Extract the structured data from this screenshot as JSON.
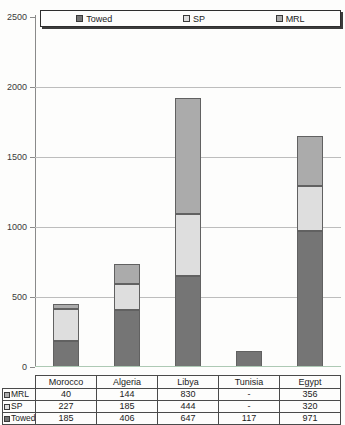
{
  "chart_data": {
    "type": "bar",
    "stacked": true,
    "title": "",
    "xlabel": "",
    "ylabel": "",
    "categories": [
      "Morocco",
      "Algeria",
      "Libya",
      "Tunisia",
      "Egypt"
    ],
    "series": [
      {
        "name": "Towed",
        "color": "#757575",
        "values": [
          185,
          406,
          647,
          117,
          971
        ]
      },
      {
        "name": "SP",
        "color": "#dedede",
        "values": [
          227,
          185,
          444,
          0,
          320
        ]
      },
      {
        "name": "MRL",
        "color": "#ababab",
        "values": [
          40,
          144,
          830,
          0,
          356
        ]
      }
    ],
    "ylim": [
      0,
      2500
    ],
    "yticks": [
      0,
      500,
      1000,
      1500,
      2000,
      2500
    ],
    "grid": true,
    "legend_position": "top",
    "legend_labels": [
      "Towed",
      "SP",
      "MRL"
    ],
    "table": {
      "corner_label": "",
      "column_headers": [
        "Morocco",
        "Algeria",
        "Libya",
        "Tunisia",
        "Egypt"
      ],
      "rows": [
        {
          "label": "MRL",
          "series": "MRL",
          "values": [
            "40",
            "144",
            "830",
            "-",
            "356"
          ]
        },
        {
          "label": "SP",
          "series": "SP",
          "values": [
            "227",
            "185",
            "444",
            "-",
            "320"
          ]
        },
        {
          "label": "Towed",
          "series": "Towed",
          "values": [
            "185",
            "406",
            "647",
            "117",
            "971"
          ]
        }
      ]
    },
    "colors": {
      "axis": "#8a8a8a",
      "gridline": "#bdbdbd",
      "bar_border": "#616161",
      "baseline_tint": "#adc9b4"
    }
  }
}
